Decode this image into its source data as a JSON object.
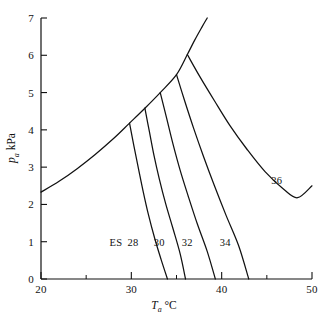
{
  "chart_data": {
    "type": "line",
    "title": "",
    "xlabel": "T_a °C",
    "ylabel": "p_a kPa",
    "xlim": [
      20,
      50
    ],
    "ylim": [
      0,
      7
    ],
    "grid": false,
    "legend": "inline-curve-labels",
    "x_ticks": [
      20,
      30,
      40,
      50
    ],
    "x_tick_labels": [
      "20",
      "30",
      "40",
      "50"
    ],
    "x_minor_ticks": [
      25,
      35,
      45
    ],
    "y_ticks": [
      0,
      1,
      2,
      3,
      4,
      5,
      6,
      7
    ],
    "y_tick_labels": [
      "0",
      "1",
      "2",
      "3",
      "4",
      "5",
      "6",
      "7"
    ],
    "series": [
      {
        "name": "ES",
        "label": "ES",
        "label_x": 28.3,
        "label_y": 1.0,
        "points": [
          [
            20.0,
            2.33
          ],
          [
            22.0,
            2.62
          ],
          [
            24.0,
            2.96
          ],
          [
            26.0,
            3.34
          ],
          [
            28.0,
            3.76
          ],
          [
            29.8,
            4.18
          ],
          [
            31.5,
            4.58
          ],
          [
            33.2,
            5.0
          ],
          [
            35.0,
            5.48
          ],
          [
            36.2,
            6.02
          ],
          [
            37.0,
            6.4
          ],
          [
            37.8,
            6.75
          ],
          [
            38.4,
            7.0
          ]
        ]
      },
      {
        "name": "28",
        "label": "28",
        "label_x": 30.1,
        "label_y": 1.0,
        "points": [
          [
            29.8,
            4.18
          ],
          [
            30.3,
            3.55
          ],
          [
            30.8,
            2.95
          ],
          [
            31.3,
            2.36
          ],
          [
            31.9,
            1.72
          ],
          [
            32.6,
            1.08
          ],
          [
            33.3,
            0.52
          ],
          [
            34.0,
            0.0
          ]
        ]
      },
      {
        "name": "30",
        "label": "30",
        "label_x": 33.1,
        "label_y": 1.0,
        "points": [
          [
            31.5,
            4.58
          ],
          [
            32.0,
            3.95
          ],
          [
            32.5,
            3.32
          ],
          [
            33.1,
            2.68
          ],
          [
            33.8,
            2.02
          ],
          [
            34.6,
            1.36
          ],
          [
            35.4,
            0.68
          ],
          [
            36.0,
            0.0
          ]
        ]
      },
      {
        "name": "32",
        "label": "32",
        "label_x": 36.2,
        "label_y": 1.0,
        "points": [
          [
            33.2,
            5.0
          ],
          [
            33.9,
            4.32
          ],
          [
            34.6,
            3.63
          ],
          [
            35.4,
            2.92
          ],
          [
            36.3,
            2.22
          ],
          [
            37.3,
            1.48
          ],
          [
            38.4,
            0.74
          ],
          [
            39.3,
            0.0
          ]
        ]
      },
      {
        "name": "34",
        "label": "34",
        "label_x": 40.3,
        "label_y": 1.0,
        "points": [
          [
            35.0,
            5.48
          ],
          [
            35.9,
            4.78
          ],
          [
            36.9,
            4.04
          ],
          [
            38.0,
            3.28
          ],
          [
            39.2,
            2.5
          ],
          [
            40.5,
            1.7
          ],
          [
            41.9,
            0.88
          ],
          [
            43.0,
            0.0
          ]
        ]
      },
      {
        "name": "36",
        "label": "36",
        "label_x": 46.1,
        "label_y": 2.66,
        "points": [
          [
            36.2,
            6.02
          ],
          [
            37.6,
            5.42
          ],
          [
            39.2,
            4.78
          ],
          [
            40.9,
            4.12
          ],
          [
            42.8,
            3.48
          ],
          [
            44.8,
            2.88
          ],
          [
            46.9,
            2.4
          ],
          [
            48.4,
            2.18
          ],
          [
            50.0,
            2.5
          ]
        ]
      }
    ],
    "curve_labels": [
      {
        "text": "ES",
        "x": 28.3,
        "y": 1.0
      },
      {
        "text": "28",
        "x": 30.2,
        "y": 1.0
      },
      {
        "text": "30",
        "x": 33.1,
        "y": 1.0
      },
      {
        "text": "32",
        "x": 36.2,
        "y": 1.0
      },
      {
        "text": "34",
        "x": 40.4,
        "y": 1.0
      },
      {
        "text": "36",
        "x": 46.1,
        "y": 2.66
      }
    ]
  },
  "axis": {
    "x_title_var": "T",
    "x_title_sub": "a",
    "x_title_unit": "°C",
    "y_title_var": "p",
    "y_title_sub": "a",
    "y_title_unit": "kPa"
  }
}
